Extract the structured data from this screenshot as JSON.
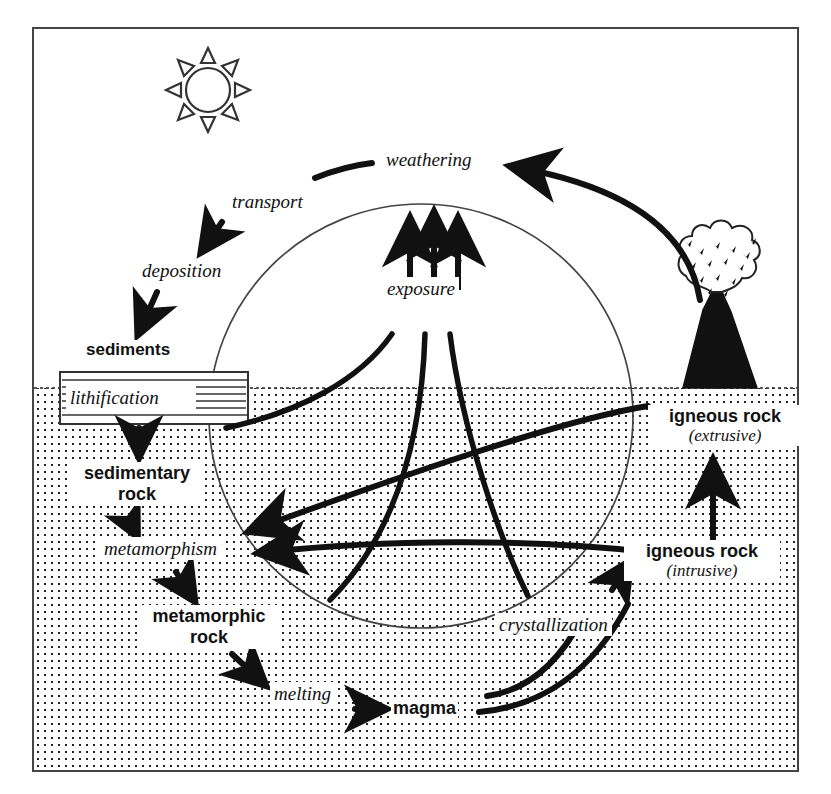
{
  "diagram": {
    "surface_label": "ground surface line separating surface (white) from subsurface (stippled)",
    "colors": {
      "ink": "#111111",
      "background": "#ffffff",
      "stipple": "#222222",
      "thin_line": "#333333"
    },
    "icons": [
      {
        "name": "sun-icon",
        "rays": 8,
        "description": "sun with eight triangular rays"
      },
      {
        "name": "volcano-icon",
        "description": "erupting volcano with ash cloud"
      },
      {
        "name": "lithification-strata-box",
        "description": "rectangle with horizontal strata hatching"
      }
    ],
    "process_labels": [
      {
        "id": "weathering",
        "text": "weathering"
      },
      {
        "id": "transport",
        "text": "transport"
      },
      {
        "id": "deposition",
        "text": "deposition"
      },
      {
        "id": "lithification",
        "text": "lithification"
      },
      {
        "id": "metamorphism",
        "text": "metamorphism"
      },
      {
        "id": "melting",
        "text": "melting"
      },
      {
        "id": "crystallization",
        "text": "crystallization"
      },
      {
        "id": "exposure",
        "text": "exposure"
      }
    ],
    "material_labels": [
      {
        "id": "sediments",
        "text": "sediments"
      },
      {
        "id": "sedimentary-rock",
        "line1": "sedimentary",
        "line2": "rock"
      },
      {
        "id": "metamorphic-rock",
        "line1": "metamorphic",
        "line2": "rock"
      },
      {
        "id": "magma",
        "text": "magma"
      },
      {
        "id": "igneous-rock-extrusive",
        "line1": "igneous rock",
        "sub": "(extrusive)"
      },
      {
        "id": "igneous-rock-intrusive",
        "line1": "igneous rock",
        "sub": "(intrusive)"
      }
    ],
    "flow": [
      {
        "from": "igneous rock (extrusive)",
        "to": "weathering",
        "via": "arc arrow over volcano"
      },
      {
        "from": "weathering",
        "to": "transport"
      },
      {
        "from": "transport",
        "to": "deposition"
      },
      {
        "from": "deposition",
        "to": "sediments"
      },
      {
        "from": "sediments",
        "to": "sedimentary rock",
        "via": "lithification"
      },
      {
        "from": "sedimentary rock",
        "to": "metamorphic rock",
        "via": "metamorphism"
      },
      {
        "from": "metamorphic rock",
        "to": "magma",
        "via": "melting"
      },
      {
        "from": "magma",
        "to": "igneous rock (intrusive)",
        "via": "crystallization"
      },
      {
        "from": "igneous rock (intrusive)",
        "to": "igneous rock (extrusive)"
      },
      {
        "from": "subsurface rocks",
        "to": "surface",
        "via": "exposure"
      }
    ]
  }
}
